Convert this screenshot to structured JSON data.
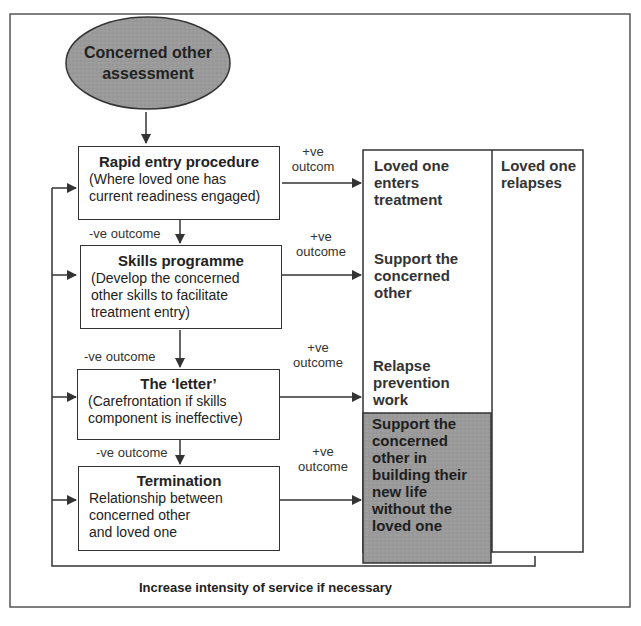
{
  "diagram": {
    "start_node": {
      "title": "Concerned other assessment",
      "line1": "Concerned other",
      "line2": "assessment",
      "fill": "#9a9a9a"
    },
    "steps": [
      {
        "title": "Rapid entry procedure",
        "lines": [
          "(Where loved one has",
          "current readiness engaged)"
        ],
        "positive_label": [
          "+ve",
          "outcom"
        ],
        "negative_label": "-ve outcome"
      },
      {
        "title": "Skills programme",
        "lines": [
          "(Develop the concerned",
          "other skills to facilitate",
          "treatment entry)"
        ],
        "positive_label": [
          "+ve",
          "outcome"
        ],
        "negative_label": "-ve outcome"
      },
      {
        "title": "The ‘letter’",
        "lines": [
          "(Carefrontation if skills",
          "component is ineffective)"
        ],
        "positive_label": [
          "+ve",
          "outcome"
        ],
        "negative_label": "-ve outcome"
      },
      {
        "title": "Termination",
        "lines": [
          "Relationship between",
          "concerned other",
          "and loved one"
        ],
        "positive_label": [
          "+ve",
          "outcome"
        ]
      }
    ],
    "outcomes": [
      {
        "lines": [
          "Loved one",
          "enters",
          "treatment"
        ]
      },
      {
        "lines": [
          "Support the",
          "concerned",
          "other"
        ]
      },
      {
        "lines": [
          "Relapse",
          "prevention",
          "work"
        ]
      },
      {
        "lines": [
          "Support the",
          "concerned",
          "other in",
          "building their",
          "new life",
          "without the",
          "loved one"
        ],
        "fill": "#8f8f8f"
      }
    ],
    "relapse_column": {
      "lines": [
        "Loved one",
        "relapses"
      ]
    },
    "feedback_label": "Increase intensity of service if necessary"
  }
}
